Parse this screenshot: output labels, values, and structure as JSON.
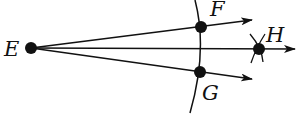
{
  "diagram": {
    "points": {
      "E": {
        "label": "E",
        "x": 31,
        "y": 48
      },
      "F": {
        "label": "F",
        "x": 201,
        "y": 27
      },
      "G": {
        "label": "G",
        "x": 200,
        "y": 72
      },
      "H": {
        "label": "H",
        "x": 259,
        "y": 49
      }
    },
    "rays": [
      "EF",
      "EH",
      "EG"
    ],
    "arcs": [
      "arc centered at E through F and G",
      "intersecting arcs at H"
    ],
    "colors": {
      "stroke": "#111111",
      "background": "#ffffff"
    }
  }
}
